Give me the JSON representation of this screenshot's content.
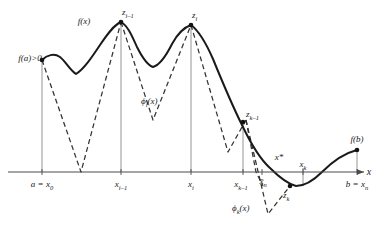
{
  "figure": {
    "axis": {
      "x_axis_label": "x",
      "baseline_y": 172
    },
    "curve_labels": {
      "f_of_x": "f(x)",
      "f_of_a": "f(a)>0",
      "f_of_b": "f(b)"
    },
    "phi_labels": {
      "phi_i": "ϕi(x)",
      "phi_i_base": "ϕ",
      "phi_i_sub": "i",
      "phi_i_arg": "(x)",
      "phi_k_base": "ϕ",
      "phi_k_sub": "k",
      "phi_k_arg": "(x)"
    },
    "peak_labels": [
      {
        "name": "z-i-minus-1",
        "base": "z",
        "sub": "i–1",
        "x": 121,
        "y": 18
      },
      {
        "name": "z-i",
        "base": "z",
        "sub": "i",
        "x": 191,
        "y": 21
      },
      {
        "name": "z-k-minus-1",
        "base": "z",
        "sub": "k–1",
        "x": 246,
        "y": 118
      },
      {
        "name": "z-k",
        "base": "z",
        "sub": "k",
        "x": 289,
        "y": 193
      }
    ],
    "x_tick_labels": [
      {
        "name": "tick-a-x0",
        "text": "a = x",
        "sub": "0",
        "x": 42
      },
      {
        "name": "tick-x-i-minus-1",
        "text": "x",
        "sub": "i–1",
        "x": 120
      },
      {
        "name": "tick-x-i",
        "text": "x",
        "sub": "i",
        "x": 190
      },
      {
        "name": "tick-x-k-minus-1",
        "text": "x",
        "sub": "k–1",
        "x": 243
      },
      {
        "name": "tick-xbar-n",
        "text": "x̄",
        "sub": "n",
        "x": 264
      },
      {
        "name": "tick-x-k",
        "text": "x",
        "sub": "k",
        "x": 303
      },
      {
        "name": "tick-b-xn",
        "text": "b = x",
        "sub": "n",
        "x": 357
      }
    ],
    "star_label": {
      "name": "x-star",
      "text": "x*",
      "x": 279,
      "y": 158
    },
    "colors": {
      "curve": "#1a1a1a",
      "phi_dashed": "#333333",
      "axis": "#4a4a4a",
      "drop_line": "#7a7a7a",
      "background": "#ffffff"
    },
    "geometry": {
      "curve_path": "M 42,60 C 48,56 54,54 60,58 C 66,63 70,70 76,74 C 84,70 92,58 100,46 C 108,34 114,26 121,22 C 128,26 132,36 136,46 C 141,56 147,64 153,66 C 160,64 166,56 172,44 C 178,34 185,27 191,25 C 199,30 206,42 213,58 C 222,80 232,104 242,124 C 252,144 262,160 270,168 C 280,177 288,184 296,186 C 306,186 314,180 322,172 C 332,162 344,153 357,150",
      "phi_i_path": "M 42,60 L 81,172 L 121,22 L 161,172 L 191,25",
      "phi_k_path": "M 246,120 L 266,215 L 289,186 L 290,186",
      "phi_a_path": "M 42,60 L 81,172 L 121,22",
      "drop_lines": [
        {
          "x": 42,
          "y_top": 60
        },
        {
          "x": 121,
          "y_top": 22
        },
        {
          "x": 191,
          "y_top": 25
        },
        {
          "x": 243,
          "y_top": 122
        },
        {
          "x": 303,
          "y_top": 168
        },
        {
          "x": 357,
          "y_top": 150
        }
      ]
    }
  }
}
